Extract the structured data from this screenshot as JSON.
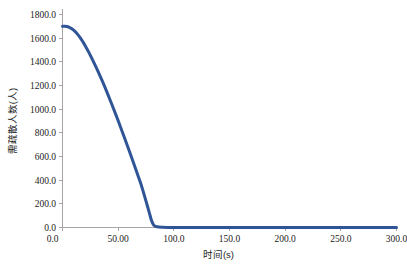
{
  "chart_data": {
    "type": "line",
    "title": "",
    "xlabel": "时间(s)",
    "ylabel": "需疏散人数(人)",
    "xlim": [
      0,
      300
    ],
    "ylim": [
      0,
      1800
    ],
    "grid": false,
    "legend": null,
    "xticks": [
      0,
      50,
      100,
      150,
      200,
      250,
      300
    ],
    "xtick_labels": [
      "0.0",
      "50.00",
      "100.0",
      "150.0",
      "200.0",
      "250.0",
      "300.0"
    ],
    "yticks": [
      0,
      200,
      400,
      600,
      800,
      1000,
      1200,
      1400,
      1600,
      1800
    ],
    "ytick_labels": [
      "0.0",
      "200.0",
      "400.0",
      "600.0",
      "800.0",
      "1000.0",
      "1200.0",
      "1400.0",
      "1600.0",
      "1800.0"
    ],
    "series": [
      {
        "name": "需疏散人数",
        "color": "#2f5597",
        "line_width": 3,
        "x": [
          0,
          2,
          4,
          6,
          8,
          10,
          12,
          14,
          16,
          18,
          20,
          24,
          28,
          32,
          36,
          40,
          44,
          48,
          52,
          56,
          60,
          64,
          68,
          70,
          72,
          74,
          76,
          78,
          80,
          82,
          85,
          90,
          100,
          120,
          140,
          160,
          180,
          200,
          220,
          240,
          260,
          280,
          300
        ],
        "y": [
          1700,
          1700,
          1698,
          1692,
          1682,
          1668,
          1650,
          1628,
          1602,
          1574,
          1543,
          1474,
          1398,
          1318,
          1232,
          1142,
          1048,
          952,
          852,
          750,
          646,
          540,
          434,
          380,
          320,
          256,
          190,
          124,
          58,
          20,
          6,
          2,
          0,
          0,
          0,
          0,
          0,
          0,
          0,
          0,
          0,
          0,
          0
        ]
      }
    ],
    "annotations": []
  },
  "axes": {
    "axis_color": "#a6a6a6",
    "tick_text_color": "#1b1b1b"
  }
}
